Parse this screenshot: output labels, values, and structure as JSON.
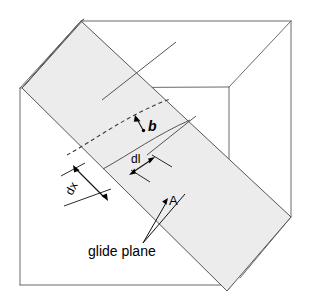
{
  "figure": {
    "background_color": "#ffffff",
    "width": 310,
    "height": 304
  },
  "colors": {
    "cube_edge": "#6b6b6b",
    "slab_fill": "#ececec",
    "slab_edge": "#555555",
    "dashed_line": "#3a3a3a",
    "annotation": "#000000"
  },
  "labels": {
    "burgers_vector": "b",
    "element_length": "dl",
    "glide_distance": "dx",
    "area": "A",
    "glide_plane": "glide plane"
  },
  "annotations": [
    {
      "name": "burgers-vector",
      "text": "b",
      "style": "bold-italic-vector"
    },
    {
      "name": "dl-dimension",
      "text": "dl",
      "style": "dimension"
    },
    {
      "name": "dx-dimension",
      "text": "dx",
      "style": "dimension-rotated"
    },
    {
      "name": "area-callout",
      "text": "A",
      "style": "leader-arrow"
    },
    {
      "name": "glide-plane-callout",
      "text": "glide plane",
      "style": "leader-line"
    }
  ],
  "geometry": {
    "cube": {
      "front_face": [
        [
          20,
          88
        ],
        [
          20,
          285
        ],
        [
          227,
          285
        ],
        [
          227,
          88
        ]
      ],
      "top_back_right": [
        291,
        21
      ],
      "top_left": [
        81,
        21
      ],
      "interior_vertex": [
        229,
        87
      ],
      "right_edge_bottom": [
        291,
        217
      ]
    },
    "slab": {
      "note": "inclined glide slab crossing the cube from upper-left to lower-right",
      "outer_quad": [
        [
          81,
          21
        ],
        [
          22,
          88
        ],
        [
          227,
          291
        ],
        [
          291,
          217
        ]
      ]
    }
  }
}
